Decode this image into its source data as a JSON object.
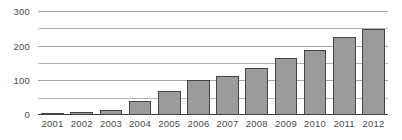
{
  "chart_data": {
    "type": "bar",
    "title": "",
    "subtitle": "",
    "xlabel": "",
    "ylabel": "",
    "categories": [
      "2001",
      "2002",
      "2003",
      "2004",
      "2005",
      "2006",
      "2007",
      "2008",
      "2009",
      "2010",
      "2011",
      "2012"
    ],
    "values": [
      5,
      8,
      15,
      40,
      70,
      100,
      112,
      135,
      165,
      188,
      225,
      248
    ],
    "ylim": [
      0,
      300
    ],
    "ytick_labels": [
      "0",
      "100",
      "200",
      "300"
    ],
    "ytick_values": [
      0,
      100,
      200,
      300
    ],
    "minor_gridline_values": [
      50,
      150,
      250
    ],
    "grid": true,
    "legend": null,
    "legend_position": "none",
    "annotations": []
  },
  "style": {
    "bar_fill": "#9b9b9b",
    "bar_border": "#444444",
    "gridline_color": "#b4b4b4",
    "axis_color": "#3c3c3c",
    "label_color": "#4a4a4a",
    "background": "#ffffff"
  }
}
